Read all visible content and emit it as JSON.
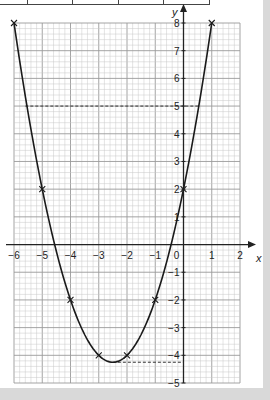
{
  "chart_data": {
    "type": "line",
    "title": "",
    "equation": "y = x^2 + 5x + 2",
    "xlabel": "x",
    "ylabel": "y",
    "xlim": [
      -6,
      2
    ],
    "ylim": [
      -5,
      8
    ],
    "grid": true,
    "x_ticks": [
      -6,
      -5,
      -4,
      -3,
      -2,
      -1,
      0,
      1,
      2
    ],
    "x_tick_labels": [
      "−6",
      "−5",
      "−4",
      "−3",
      "−2",
      "−1",
      "0",
      "1",
      "2"
    ],
    "y_ticks": [
      -5,
      -4,
      -3,
      -2,
      -1,
      1,
      2,
      3,
      4,
      5,
      6,
      7,
      8
    ],
    "y_tick_labels": [
      "−5",
      "−4",
      "−3",
      "−2",
      "−1",
      "1",
      "2",
      "3",
      "4",
      "5",
      "6",
      "7",
      "8"
    ],
    "series": [
      {
        "name": "curve",
        "x": [
          -6,
          -5,
          -4,
          -3,
          -2,
          -1,
          0,
          1
        ],
        "y": [
          8,
          2,
          -2,
          -4,
          -4,
          -2,
          2,
          8
        ],
        "marker": "cross"
      }
    ],
    "annotations": [
      {
        "type": "dashed-hline",
        "y": 5,
        "x_from": -5.6,
        "x_to": 0.56
      },
      {
        "type": "dashed-hline",
        "y": -4.25,
        "x_from": -2.5,
        "x_to": 0
      }
    ]
  }
}
